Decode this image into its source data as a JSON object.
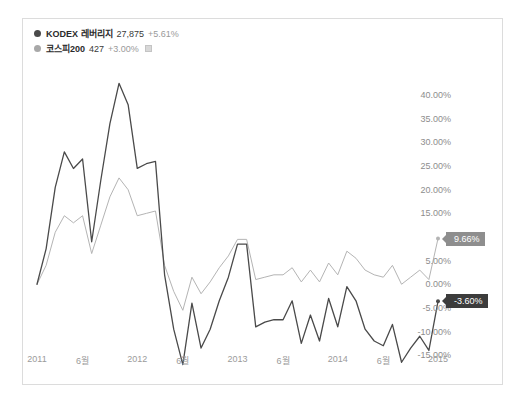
{
  "legend": {
    "items": [
      {
        "name": "KODEX 레버리지",
        "value": "27,875",
        "change": "+5.61%",
        "color": "#4a4a4a",
        "closable": false
      },
      {
        "name": "코스피200",
        "value": "427",
        "change": "+3.00%",
        "color": "#a8a8a8",
        "closable": true
      }
    ]
  },
  "badges": {
    "primary": "-3.60%",
    "secondary": "9.66%"
  },
  "chart_data": {
    "type": "line",
    "title": "",
    "xlabel": "",
    "ylabel": "",
    "ylim": [
      -17.5,
      43.0
    ],
    "ytick_labels": [
      "40.00%",
      "35.00%",
      "30.00%",
      "25.00%",
      "20.00%",
      "15.00%",
      "10.00%",
      "5.00%",
      "0.00%",
      "-5.00%",
      "-10.00%",
      "-15.00%"
    ],
    "ytick_values": [
      40,
      35,
      30,
      25,
      20,
      15,
      10,
      5,
      0,
      -5,
      -10,
      -15
    ],
    "ytick_hidden": [
      10
    ],
    "xtick_labels": [
      "2011",
      "6월",
      "2012",
      "6월",
      "2013",
      "6월",
      "2014",
      "6월",
      "2015"
    ],
    "xtick_positions": [
      0,
      5,
      11,
      16,
      22,
      27,
      33,
      38,
      44
    ],
    "grid": false,
    "legend_position": "top-left",
    "series": [
      {
        "name": "KODEX 레버리지",
        "color": "#4a4a4a",
        "width": 1.3,
        "end_label": "-3.60%",
        "values": [
          0.0,
          7.5,
          20.5,
          28.0,
          24.5,
          26.5,
          9.0,
          22.0,
          34.0,
          42.5,
          38.0,
          24.5,
          25.5,
          26.0,
          2.0,
          -9.5,
          -17.0,
          -4.0,
          -13.5,
          -9.5,
          -3.5,
          1.5,
          8.5,
          8.5,
          -9.0,
          -8.0,
          -7.5,
          -7.5,
          -3.5,
          -12.5,
          -6.5,
          -12.0,
          -3.0,
          -9.0,
          -0.5,
          -3.5,
          -9.5,
          -12.0,
          -13.0,
          -8.5,
          -16.5,
          -13.5,
          -11.0,
          -14.0,
          -3.6
        ]
      },
      {
        "name": "코스피200",
        "color": "#b4b4b4",
        "width": 1.0,
        "end_label": "9.66%",
        "values": [
          0.0,
          4.0,
          11.0,
          14.5,
          13.0,
          14.5,
          6.5,
          12.5,
          18.5,
          22.5,
          20.0,
          14.5,
          15.0,
          15.5,
          4.0,
          -1.5,
          -5.5,
          1.5,
          -2.0,
          0.5,
          3.5,
          6.0,
          9.5,
          9.5,
          1.0,
          1.5,
          2.0,
          2.0,
          3.5,
          0.5,
          3.0,
          0.5,
          4.5,
          2.0,
          7.0,
          5.5,
          3.0,
          2.0,
          1.5,
          4.0,
          0.0,
          1.5,
          3.0,
          1.0,
          9.66
        ]
      }
    ]
  }
}
